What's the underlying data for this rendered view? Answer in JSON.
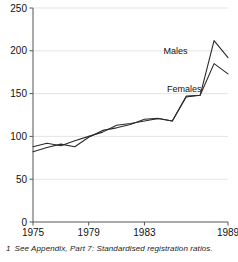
{
  "chart_data": {
    "type": "line",
    "title": "",
    "subtitle": "",
    "xlabel": "",
    "ylabel": "",
    "x": [
      1975,
      1976,
      1977,
      1978,
      1979,
      1980,
      1981,
      1982,
      1983,
      1984,
      1985,
      1986,
      1987,
      1988,
      1989
    ],
    "xlim": [
      1975,
      1989
    ],
    "ylim": [
      0,
      250
    ],
    "yticks": [
      0,
      50,
      100,
      150,
      200,
      250
    ],
    "xticks": [
      1975,
      1979,
      1983,
      1989
    ],
    "xtick_labels": [
      "1975",
      "1979",
      "1983",
      "1989"
    ],
    "ytick_labels": [
      "0",
      "50",
      "100",
      "150",
      "200",
      "250"
    ],
    "grid": "horizontal",
    "legend_position": "inline-annotation",
    "series": [
      {
        "name": "Males",
        "label": "Males",
        "color": "#2a2a2a",
        "values": [
          88,
          92,
          89,
          95,
          100,
          105,
          113,
          115,
          118,
          121,
          118,
          147,
          148,
          212,
          192
        ]
      },
      {
        "name": "Females",
        "label": "Females",
        "color": "#2a2a2a",
        "values": [
          82,
          87,
          91,
          88,
          99,
          107,
          110,
          114,
          120,
          121,
          118,
          146,
          148,
          185,
          173
        ]
      }
    ],
    "annotations": [
      {
        "text": "Males",
        "x": 1986.1,
        "y": 196
      },
      {
        "text": "Females",
        "x": 1987.1,
        "y": 152
      }
    ]
  },
  "footnote": {
    "marker": "1",
    "text": "See Appendix, Part 7: Standardised registration ratios."
  }
}
